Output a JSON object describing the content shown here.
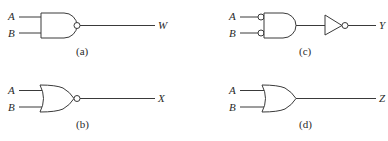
{
  "diagram": {
    "type": "logic-gate-circuits",
    "circuits": [
      {
        "id": "a",
        "caption": "(a)",
        "gate": "NAND",
        "inputs": [
          "A",
          "B"
        ],
        "output": "W"
      },
      {
        "id": "b",
        "caption": "(b)",
        "gate": "NOR",
        "inputs": [
          "A",
          "B"
        ],
        "output": "X"
      },
      {
        "id": "c",
        "caption": "(c)",
        "gate": "AND with inverted inputs followed by NOT",
        "inputs": [
          "A",
          "B"
        ],
        "output": "Y"
      },
      {
        "id": "d",
        "caption": "(d)",
        "gate": "OR",
        "inputs": [
          "A",
          "B"
        ],
        "output": "Z"
      }
    ]
  }
}
